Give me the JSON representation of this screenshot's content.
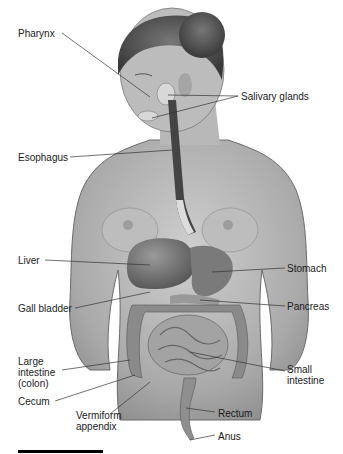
{
  "diagram": {
    "type": "anatomical-illustration",
    "labels": [
      {
        "id": "pharynx",
        "text": "Pharynx",
        "x": 18,
        "y": 30,
        "side": "left"
      },
      {
        "id": "salivary-glands",
        "text": "Salivary glands",
        "x": 240,
        "y": 93,
        "side": "right"
      },
      {
        "id": "esophagus",
        "text": "Esophagus",
        "x": 18,
        "y": 153,
        "side": "left"
      },
      {
        "id": "liver",
        "text": "Liver",
        "x": 18,
        "y": 256,
        "side": "left"
      },
      {
        "id": "stomach",
        "text": "Stomach",
        "x": 287,
        "y": 265,
        "side": "right"
      },
      {
        "id": "gall-bladder",
        "text": "Gall bladder",
        "x": 18,
        "y": 303,
        "side": "left"
      },
      {
        "id": "pancreas",
        "text": "Pancreas",
        "x": 287,
        "y": 303,
        "side": "right"
      },
      {
        "id": "large-intestine",
        "text": "Large intestine (colon)",
        "lines": [
          "Large",
          "intestine",
          "(colon)"
        ],
        "x": 18,
        "y": 354,
        "side": "left"
      },
      {
        "id": "small-intestine",
        "text": "Small intestine",
        "lines": [
          "Small",
          "intestine"
        ],
        "x": 287,
        "y": 366,
        "side": "right"
      },
      {
        "id": "cecum",
        "text": "Cecum",
        "x": 18,
        "y": 397,
        "side": "left"
      },
      {
        "id": "vermiform-appendix",
        "text": "Vermiform appendix",
        "lines": [
          "Vermiform",
          "appendix"
        ],
        "x": 76,
        "y": 411,
        "side": "bottom"
      },
      {
        "id": "rectum",
        "text": "Rectum",
        "x": 218,
        "y": 408,
        "side": "right"
      },
      {
        "id": "anus",
        "text": "Anus",
        "x": 218,
        "y": 431,
        "side": "right"
      }
    ],
    "colors": {
      "background": "#ffffff",
      "skin": "#b3b3b3",
      "organ_dark": "#6e6e6e",
      "label_text": "#1a1a1a",
      "leader_line": "#333333",
      "scale_bar": "#000000"
    }
  }
}
